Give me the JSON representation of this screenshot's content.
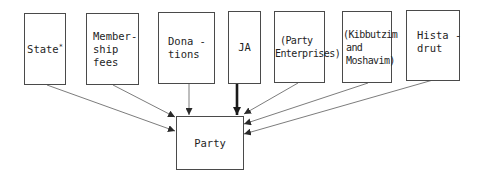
{
  "diagram": {
    "sources": [
      {
        "id": "state",
        "lines": [
          "State"
        ],
        "marker": "*"
      },
      {
        "id": "membership",
        "lines": [
          "Member-",
          "ship",
          "fees"
        ]
      },
      {
        "id": "donations",
        "lines": [
          "Dona -",
          "tions"
        ]
      },
      {
        "id": "ja",
        "lines": [
          "JA"
        ]
      },
      {
        "id": "party-enterprises",
        "lines": [
          "(Party",
          "Enterprises)"
        ]
      },
      {
        "id": "kibbutzim",
        "lines": [
          "(Kibbutzim",
          "and",
          "Moshavim)"
        ]
      },
      {
        "id": "histadrut",
        "lines": [
          "Hista -",
          "drut"
        ]
      }
    ],
    "target": {
      "id": "party",
      "label": "Party"
    },
    "edges": [
      {
        "from": "state",
        "to": "party",
        "weight": "thin"
      },
      {
        "from": "membership",
        "to": "party",
        "weight": "thin"
      },
      {
        "from": "donations",
        "to": "party",
        "weight": "thin"
      },
      {
        "from": "ja",
        "to": "party",
        "weight": "thick"
      },
      {
        "from": "party-enterprises",
        "to": "party",
        "weight": "thin"
      },
      {
        "from": "kibbutzim",
        "to": "party",
        "weight": "thin"
      },
      {
        "from": "histadrut",
        "to": "party",
        "weight": "thin"
      }
    ],
    "colors": {
      "stroke": "#4a4a4a",
      "text": "#1e1e1e",
      "background": "#ffffff"
    }
  }
}
